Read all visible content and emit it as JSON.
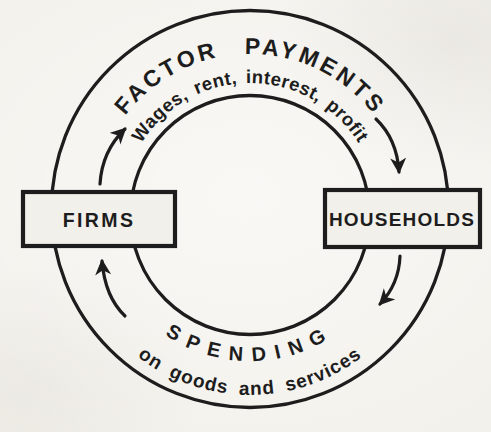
{
  "colors": {
    "ink": "#1d1d1d",
    "paper": "#f2f0ea"
  },
  "diagram": {
    "type": "circular-flow",
    "top_flow": {
      "label": "FACTOR PAYMENTS",
      "sublabel": "Wages, rent, interest, profit"
    },
    "bottom_flow": {
      "label": "SPENDING",
      "sublabel": "on goods and services"
    },
    "left_node": {
      "label": "FIRMS"
    },
    "right_node": {
      "label": "HOUSEHOLDS"
    },
    "icons": {
      "top_left_arrow": "curved-arrow-up-right",
      "top_right_arrow": "curved-arrow-down",
      "bottom_right_arrow": "curved-arrow-down-left",
      "bottom_left_arrow": "curved-arrow-up"
    },
    "flow_direction": "clockwise"
  }
}
